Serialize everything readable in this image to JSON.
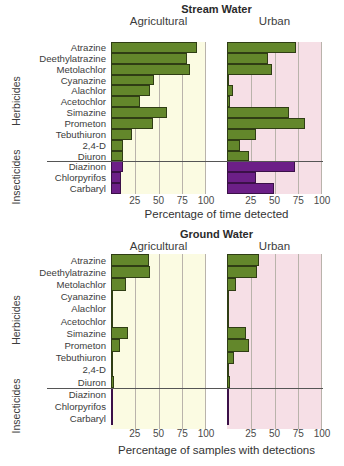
{
  "chart_data": [
    {
      "type": "bar",
      "orientation": "horizontal",
      "title": "Stream Water",
      "xlabel": "Percentage of time detected",
      "xlim": [
        0,
        100
      ],
      "xticks": [
        25,
        50,
        75,
        100
      ],
      "groups": [
        {
          "name": "Herbicides",
          "categories": [
            "Atrazine",
            "Deethylatrazine",
            "Metolachlor",
            "Cyanazine",
            "Alachlor",
            "Acetochlor",
            "Simazine",
            "Prometon",
            "Tebuthiuron",
            "2,4-D",
            "Diuron"
          ]
        },
        {
          "name": "Insecticides",
          "categories": [
            "Diazinon",
            "Chlorpyrifos",
            "Carbaryl"
          ]
        }
      ],
      "categories": [
        "Atrazine",
        "Deethylatrazine",
        "Metolachlor",
        "Cyanazine",
        "Alachlor",
        "Acetochlor",
        "Simazine",
        "Prometon",
        "Tebuthiuron",
        "2,4-D",
        "Diuron",
        "Diazinon",
        "Chlorpyrifos",
        "Carbaryl"
      ],
      "series": [
        {
          "name": "Agricultural",
          "values": [
            90,
            80,
            83,
            45,
            41,
            30,
            59,
            44,
            22,
            13,
            13,
            13,
            11,
            10
          ]
        },
        {
          "name": "Urban",
          "values": [
            73,
            43,
            47,
            2,
            6,
            3,
            65,
            82,
            31,
            14,
            23,
            72,
            31,
            49
          ]
        }
      ],
      "grid": true
    },
    {
      "type": "bar",
      "orientation": "horizontal",
      "title": "Ground Water",
      "xlabel": "Percentage of samples with detections",
      "xlim": [
        0,
        100
      ],
      "xticks": [
        25,
        50,
        75,
        100
      ],
      "groups": [
        {
          "name": "Herbicides",
          "categories": [
            "Atrazine",
            "Deethylatrazine",
            "Metolachlor",
            "Cyanazine",
            "Alachlor",
            "Acetochlor",
            "Simazine",
            "Prometon",
            "Tebuthiuron",
            "2,4-D",
            "Diuron"
          ]
        },
        {
          "name": "Insecticides",
          "categories": [
            "Diazinon",
            "Chlorpyrifos",
            "Carbaryl"
          ]
        }
      ],
      "categories": [
        "Atrazine",
        "Deethylatrazine",
        "Metolachlor",
        "Cyanazine",
        "Alachlor",
        "Acetochlor",
        "Simazine",
        "Prometon",
        "Tebuthiuron",
        "2,4-D",
        "Diuron",
        "Diazinon",
        "Chlorpyrifos",
        "Carbaryl"
      ],
      "series": [
        {
          "name": "Agricultural",
          "values": [
            40,
            41,
            16,
            1,
            2,
            0.5,
            18,
            9,
            1,
            0.3,
            3,
            0.3,
            0.8,
            0.8
          ]
        },
        {
          "name": "Urban",
          "values": [
            34,
            32,
            9,
            0.5,
            0.5,
            0.5,
            20,
            23,
            7,
            0.5,
            3,
            1,
            1,
            1.5
          ]
        }
      ],
      "grid": true
    }
  ],
  "colors": {
    "herbicide_bar": "#63872b",
    "insecticide_bar": "#6c1f87",
    "agricultural_bg": "#fbfbe2",
    "urban_bg": "#f6dfe6"
  },
  "panels": {
    "agricultural_label": "Agricultural",
    "urban_label": "Urban"
  },
  "group_labels": {
    "herbicides": "Herbicides",
    "insecticides": "Insecticides"
  }
}
